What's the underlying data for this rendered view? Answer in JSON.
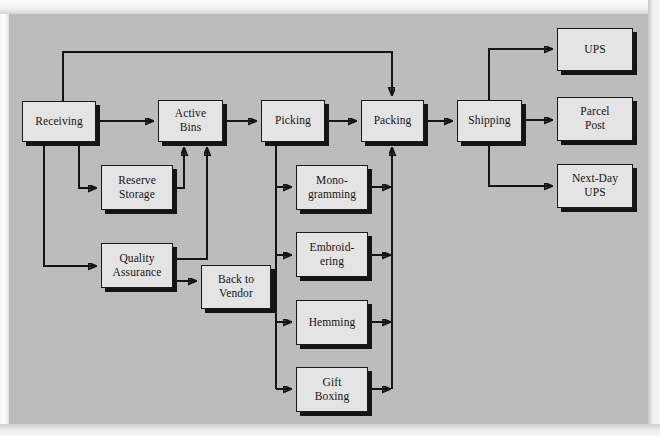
{
  "diagram": {
    "type": "flowchart",
    "background_color": "#bdbdbd",
    "node_fill_color": "#e4e4e4",
    "line_color": "#151515",
    "nodes": [
      {
        "id": "receiving",
        "label": "Receiving",
        "x": 22,
        "y": 101,
        "w": 74,
        "h": 41
      },
      {
        "id": "active-bins",
        "label": "Active\nBins",
        "x": 158,
        "y": 100,
        "w": 65,
        "h": 42
      },
      {
        "id": "picking",
        "label": "Picking",
        "x": 261,
        "y": 100,
        "w": 64,
        "h": 42
      },
      {
        "id": "packing",
        "label": "Packing",
        "x": 361,
        "y": 100,
        "w": 63,
        "h": 42
      },
      {
        "id": "shipping",
        "label": "Shipping",
        "x": 457,
        "y": 100,
        "w": 65,
        "h": 42
      },
      {
        "id": "reserve-storage",
        "label": "Reserve\nStorage",
        "x": 101,
        "y": 165,
        "w": 72,
        "h": 45
      },
      {
        "id": "quality-assurance",
        "label": "Quality\nAssurance",
        "x": 101,
        "y": 243,
        "w": 72,
        "h": 45
      },
      {
        "id": "back-to-vendor",
        "label": "Back to\nVendor",
        "x": 201,
        "y": 265,
        "w": 70,
        "h": 44
      },
      {
        "id": "monogramming",
        "label": "Mono-\ngramming",
        "x": 296,
        "y": 165,
        "w": 72,
        "h": 45
      },
      {
        "id": "embroidering",
        "label": "Embroid-\nering",
        "x": 296,
        "y": 232,
        "w": 72,
        "h": 45
      },
      {
        "id": "hemming",
        "label": "Hemming",
        "x": 296,
        "y": 300,
        "w": 72,
        "h": 45
      },
      {
        "id": "gift-boxing",
        "label": "Gift\nBoxing",
        "x": 296,
        "y": 367,
        "w": 72,
        "h": 45
      },
      {
        "id": "ups",
        "label": "UPS",
        "x": 557,
        "y": 28,
        "w": 76,
        "h": 43
      },
      {
        "id": "parcel-post",
        "label": "Parcel\nPost",
        "x": 557,
        "y": 97,
        "w": 76,
        "h": 44
      },
      {
        "id": "next-day-ups",
        "label": "Next-Day\nUPS",
        "x": 557,
        "y": 164,
        "w": 76,
        "h": 44
      }
    ],
    "edges": [
      {
        "from": "receiving",
        "to": "active-bins"
      },
      {
        "from": "active-bins",
        "to": "picking"
      },
      {
        "from": "picking",
        "to": "packing"
      },
      {
        "from": "packing",
        "to": "shipping"
      },
      {
        "from": "receiving",
        "to": "reserve-storage"
      },
      {
        "from": "receiving",
        "to": "quality-assurance"
      },
      {
        "from": "receiving",
        "to": "packing",
        "route": "top-bypass"
      },
      {
        "from": "reserve-storage",
        "to": "active-bins"
      },
      {
        "from": "quality-assurance",
        "to": "active-bins"
      },
      {
        "from": "quality-assurance",
        "to": "back-to-vendor"
      },
      {
        "from": "picking",
        "to": "monogramming"
      },
      {
        "from": "picking",
        "to": "embroidering"
      },
      {
        "from": "picking",
        "to": "hemming"
      },
      {
        "from": "picking",
        "to": "gift-boxing"
      },
      {
        "from": "monogramming",
        "to": "packing"
      },
      {
        "from": "embroidering",
        "to": "packing"
      },
      {
        "from": "hemming",
        "to": "packing"
      },
      {
        "from": "gift-boxing",
        "to": "packing"
      },
      {
        "from": "shipping",
        "to": "ups"
      },
      {
        "from": "shipping",
        "to": "parcel-post"
      },
      {
        "from": "shipping",
        "to": "next-day-ups"
      }
    ]
  }
}
